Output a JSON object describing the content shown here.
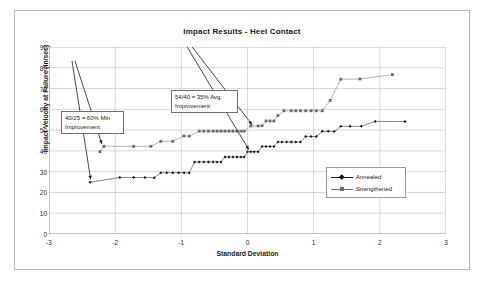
{
  "chart_data": {
    "type": "scatter",
    "title": "Impact Results - Heel Contact",
    "xlabel": "Standard Deviation",
    "ylabel": "Impact Velocity at Failure (in/sec)",
    "xlim": [
      -3,
      3
    ],
    "ylim": [
      0,
      90
    ],
    "xticks": [
      -3,
      -2,
      -1,
      0,
      1,
      2,
      3
    ],
    "xtick_labels": [
      "-3",
      "-2",
      "-1",
      "0",
      "1",
      "2",
      "3"
    ],
    "yticks": [
      0,
      10,
      20,
      30,
      40,
      50,
      60,
      70,
      80,
      90
    ],
    "ytick_labels": [
      "0",
      "10",
      "20",
      "30",
      "40",
      "50",
      "60",
      "70",
      "80",
      "90"
    ],
    "grid": true,
    "legend_position": "center-right",
    "series": [
      {
        "name": "Annealed",
        "color": "#1a1a1a",
        "marker": "diamond",
        "points": [
          [
            -2.38,
            24.9
          ],
          [
            -1.93,
            27.2
          ],
          [
            -1.72,
            27.2
          ],
          [
            -1.55,
            27.2
          ],
          [
            -1.41,
            27.1
          ],
          [
            -1.31,
            29.5
          ],
          [
            -1.22,
            29.5
          ],
          [
            -1.13,
            29.5
          ],
          [
            -1.04,
            29.5
          ],
          [
            -0.96,
            29.5
          ],
          [
            -0.88,
            29.4
          ],
          [
            -0.8,
            34.7
          ],
          [
            -0.73,
            34.7
          ],
          [
            -0.66,
            34.7
          ],
          [
            -0.59,
            34.7
          ],
          [
            -0.52,
            34.7
          ],
          [
            -0.46,
            34.7
          ],
          [
            -0.4,
            34.6
          ],
          [
            -0.34,
            37.1
          ],
          [
            -0.28,
            37.1
          ],
          [
            -0.22,
            37.1
          ],
          [
            -0.16,
            37.1
          ],
          [
            -0.1,
            37.1
          ],
          [
            -0.05,
            37.0
          ],
          [
            0.0,
            39.6
          ],
          [
            0.05,
            39.6
          ],
          [
            0.1,
            39.6
          ],
          [
            0.16,
            39.6
          ],
          [
            0.22,
            42.1
          ],
          [
            0.28,
            42.1
          ],
          [
            0.34,
            42.1
          ],
          [
            0.4,
            42.1
          ],
          [
            0.46,
            44.3
          ],
          [
            0.52,
            44.3
          ],
          [
            0.59,
            44.3
          ],
          [
            0.66,
            44.3
          ],
          [
            0.73,
            44.3
          ],
          [
            0.8,
            44.3
          ],
          [
            0.88,
            46.9
          ],
          [
            0.96,
            46.9
          ],
          [
            1.04,
            46.9
          ],
          [
            1.13,
            49.4
          ],
          [
            1.22,
            49.4
          ],
          [
            1.31,
            49.3
          ],
          [
            1.41,
            51.8
          ],
          [
            1.55,
            51.8
          ],
          [
            1.72,
            51.8
          ],
          [
            1.93,
            54.2
          ],
          [
            2.38,
            54.1
          ]
        ]
      },
      {
        "name": "Strengthened",
        "color": "#6b6b6b",
        "marker": "square",
        "points": [
          [
            -2.23,
            39.6
          ],
          [
            -2.17,
            42.2
          ],
          [
            -1.72,
            42.2
          ],
          [
            -1.46,
            42.2
          ],
          [
            -1.31,
            44.6
          ],
          [
            -1.13,
            44.6
          ],
          [
            -0.96,
            47.2
          ],
          [
            -0.88,
            47.1
          ],
          [
            -0.73,
            49.5
          ],
          [
            -0.66,
            49.5
          ],
          [
            -0.59,
            49.5
          ],
          [
            -0.52,
            49.5
          ],
          [
            -0.46,
            49.5
          ],
          [
            -0.4,
            49.5
          ],
          [
            -0.34,
            49.5
          ],
          [
            -0.28,
            49.5
          ],
          [
            -0.22,
            49.5
          ],
          [
            -0.16,
            49.5
          ],
          [
            -0.1,
            49.5
          ],
          [
            -0.05,
            49.5
          ],
          [
            0.05,
            52.0
          ],
          [
            0.16,
            52.0
          ],
          [
            0.22,
            52.1
          ],
          [
            0.28,
            54.4
          ],
          [
            0.34,
            54.4
          ],
          [
            0.4,
            54.4
          ],
          [
            0.46,
            57.0
          ],
          [
            0.55,
            59.3
          ],
          [
            0.66,
            59.3
          ],
          [
            0.73,
            59.3
          ],
          [
            0.8,
            59.3
          ],
          [
            0.88,
            59.3
          ],
          [
            0.96,
            59.3
          ],
          [
            1.04,
            59.3
          ],
          [
            1.13,
            59.3
          ],
          [
            1.25,
            64.3
          ],
          [
            1.41,
            74.5
          ],
          [
            1.7,
            74.6
          ],
          [
            2.19,
            76.7
          ]
        ]
      }
    ],
    "annotations": [
      {
        "id": "min-improvement",
        "text": "40/25 = 60% Min\nImprovement",
        "arrows": 2
      },
      {
        "id": "avg-improvement",
        "text": "54/40 = 35% Avg.\nImprovement",
        "arrows": 2
      }
    ]
  },
  "legend": {
    "entries": [
      {
        "label": "Annealed",
        "color": "#1a1a1a",
        "marker": "diamond"
      },
      {
        "label": "Strengthened",
        "color": "#6b6b6b",
        "marker": "square"
      }
    ]
  },
  "annotations": {
    "min_improvement": "40/25 = 60% Min\nImprovement",
    "avg_improvement": "54/40 = 35% Avg.\nImprovement"
  },
  "colors": {
    "annealed": "#1a1a1a",
    "strengthened": "#6b6b6b",
    "grid": "#c9c9c9",
    "axis": "#8a8a8a",
    "frame": "#b8b8b8"
  }
}
